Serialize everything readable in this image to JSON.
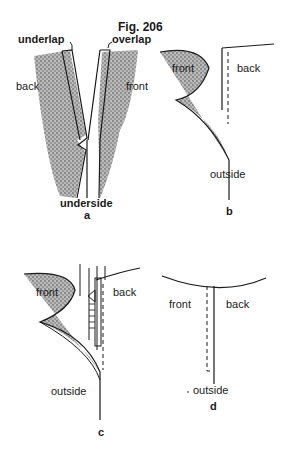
{
  "figure": {
    "title": "Fig. 206",
    "panels": [
      {
        "id": "a",
        "caption": "a",
        "labels": {
          "underlap": "underlap",
          "overlap": "overlap",
          "back": "back",
          "front": "front",
          "underside": "underside"
        }
      },
      {
        "id": "b",
        "caption": "b",
        "labels": {
          "front": "front",
          "back": "back",
          "outside": "outside"
        }
      },
      {
        "id": "c",
        "caption": "c",
        "labels": {
          "front": "front",
          "back": "back",
          "outside": "outside"
        }
      },
      {
        "id": "d",
        "caption": "d",
        "labels": {
          "front": "front",
          "back": "back",
          "outside": "outside"
        }
      }
    ]
  },
  "colors": {
    "ink": "#1a1a1a",
    "shade": "#8a8a8a",
    "paper": "#ffffff"
  }
}
